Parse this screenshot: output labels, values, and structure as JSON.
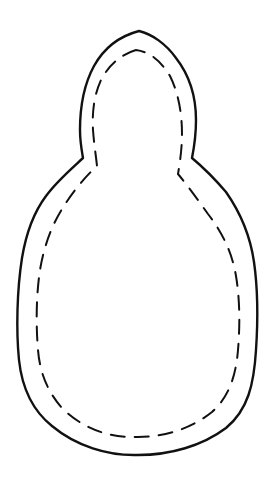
{
  "figure": {
    "description": "Sewing pattern template: gourd / snowman-like shape with solid cut line and dashed stitch line",
    "colors": {
      "background": "#ffffff",
      "outline": "#111111",
      "stitch_line": "#111111"
    },
    "outline": {
      "style": "solid",
      "stroke_width": 2.4
    },
    "stitch_line": {
      "style": "dashed",
      "stroke_width": 2,
      "dash": "14 10"
    }
  }
}
